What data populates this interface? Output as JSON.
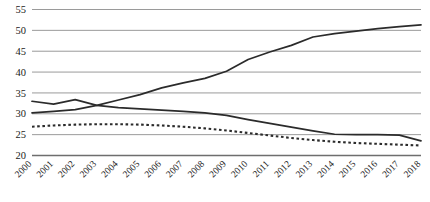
{
  "chart_data": {
    "type": "line",
    "title": "",
    "subtitle": "",
    "xlabel": "",
    "ylabel": "",
    "grid": true,
    "legend_position": "none",
    "xlim": [
      2000,
      2018
    ],
    "ylim": [
      20,
      55
    ],
    "ytick_step": 5,
    "categories": [
      "2000",
      "2001",
      "2002",
      "2003",
      "2004",
      "2005",
      "2006",
      "2007",
      "2008",
      "2009",
      "2010",
      "2011",
      "2012",
      "2013",
      "2014",
      "2015",
      "2016",
      "2017",
      "2018"
    ],
    "ytick_labels": [
      "20",
      "25",
      "30",
      "35",
      "40",
      "45",
      "50",
      "55"
    ],
    "ytick_values": [
      20,
      25,
      30,
      35,
      40,
      45,
      50,
      55
    ],
    "series": [
      {
        "name": "series-1",
        "style": "solid",
        "color": "#2b2b2b",
        "values": [
          33.0,
          32.3,
          33.4,
          32.0,
          31.5,
          31.2,
          30.9,
          30.6,
          30.2,
          29.6,
          28.6,
          27.7,
          26.8,
          25.9,
          25.1,
          25.0,
          25.0,
          24.9,
          23.5
        ]
      },
      {
        "name": "series-2",
        "style": "solid",
        "color": "#2b2b2b",
        "values": [
          30.2,
          30.6,
          31.0,
          32.0,
          33.3,
          34.6,
          36.2,
          37.4,
          38.5,
          40.2,
          43.0,
          44.8,
          46.4,
          48.4,
          49.2,
          49.8,
          50.4,
          50.9,
          51.3
        ]
      },
      {
        "name": "series-3",
        "style": "dotted",
        "color": "#2b2b2b",
        "values": [
          26.9,
          27.2,
          27.4,
          27.5,
          27.5,
          27.4,
          27.2,
          26.9,
          26.5,
          26.0,
          25.4,
          24.8,
          24.2,
          23.7,
          23.3,
          23.0,
          22.8,
          22.6,
          22.4
        ]
      }
    ]
  }
}
